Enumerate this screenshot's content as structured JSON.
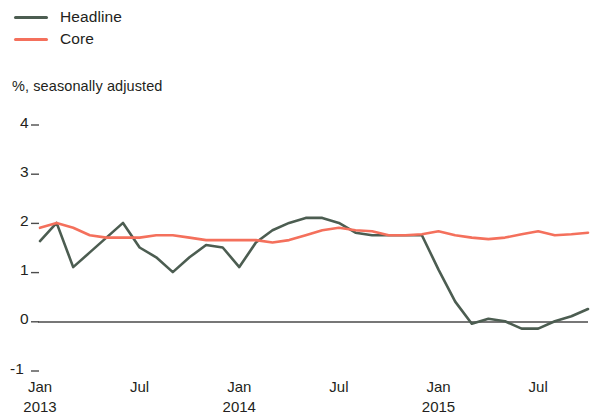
{
  "legend": {
    "position": "top-left",
    "entries": [
      {
        "label": "Headline",
        "color": "#4c5d51",
        "key": "headline"
      },
      {
        "label": "Core",
        "color": "#f4705c",
        "key": "core"
      }
    ]
  },
  "subtitle": "%, seasonally adjusted",
  "axis": {
    "y_ticks": [
      "4",
      "3",
      "2",
      "1",
      "0",
      "-1"
    ],
    "x_months": [
      "Jan",
      "Jul",
      "Jan",
      "Jul",
      "Jan",
      "Jul"
    ],
    "x_years": [
      "2013",
      "",
      "2014",
      "",
      "2015",
      ""
    ]
  },
  "chart_data": {
    "type": "line",
    "title": "",
    "subtitle": "%, seasonally adjusted",
    "xlabel": "",
    "ylabel": "",
    "ylim": [
      -1,
      4
    ],
    "ytick_values": [
      4,
      3,
      2,
      1,
      0,
      -1
    ],
    "grid": false,
    "zero_line": true,
    "legend_position": "top-left",
    "x": [
      "Jan 2013",
      "Feb 2013",
      "Mar 2013",
      "Apr 2013",
      "May 2013",
      "Jun 2013",
      "Jul 2013",
      "Aug 2013",
      "Sep 2013",
      "Oct 2013",
      "Nov 2013",
      "Dec 2013",
      "Jan 2014",
      "Feb 2014",
      "Mar 2014",
      "Apr 2014",
      "May 2014",
      "Jun 2014",
      "Jul 2014",
      "Aug 2014",
      "Sep 2014",
      "Oct 2014",
      "Nov 2014",
      "Dec 2014",
      "Jan 2015",
      "Feb 2015",
      "Mar 2015",
      "Apr 2015",
      "May 2015",
      "Jun 2015",
      "Jul 2015",
      "Aug 2015",
      "Sep 2015",
      "Oct 2015"
    ],
    "x_tick_labels": [
      "Jan 2013",
      "Jul",
      "Jan 2014",
      "Jul",
      "Jan 2015",
      "Jul"
    ],
    "x_tick_indices": [
      0,
      6,
      12,
      18,
      24,
      30
    ],
    "series": [
      {
        "name": "Headline",
        "color": "#4c5d51",
        "values": [
          1.58,
          1.95,
          1.05,
          1.35,
          1.65,
          1.95,
          1.45,
          1.25,
          0.95,
          1.25,
          1.5,
          1.45,
          1.05,
          1.55,
          1.8,
          1.95,
          2.05,
          2.05,
          1.95,
          1.75,
          1.7,
          1.7,
          1.7,
          1.7,
          1.0,
          0.35,
          -0.1,
          0.0,
          -0.05,
          -0.2,
          -0.2,
          -0.05,
          0.05,
          0.2
        ]
      },
      {
        "name": "Core",
        "color": "#f4705c",
        "values": [
          1.85,
          1.95,
          1.85,
          1.7,
          1.65,
          1.65,
          1.65,
          1.7,
          1.7,
          1.65,
          1.6,
          1.6,
          1.6,
          1.6,
          1.55,
          1.6,
          1.7,
          1.8,
          1.85,
          1.8,
          1.78,
          1.7,
          1.7,
          1.72,
          1.78,
          1.7,
          1.65,
          1.62,
          1.65,
          1.72,
          1.78,
          1.7,
          1.72,
          1.75
        ]
      }
    ]
  }
}
